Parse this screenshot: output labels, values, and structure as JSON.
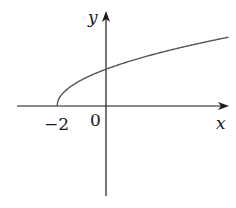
{
  "chart_data": {
    "type": "line",
    "title": "",
    "function": "y = sqrt(x + 2)",
    "xlabel": "x",
    "ylabel": "y",
    "x_tick_labels": [
      "-2",
      "0"
    ],
    "x": [
      -2,
      -1.5,
      -1,
      0,
      1,
      2,
      3,
      4,
      5
    ],
    "series": [
      {
        "name": "curve",
        "values": [
          0,
          0.707,
          1,
          1.414,
          1.732,
          2,
          2.236,
          2.449,
          2.646
        ]
      }
    ],
    "xlim": [
      -3.8,
      5.2
    ],
    "ylim": [
      -3.5,
      3.6
    ],
    "grid": false,
    "legend": "none"
  },
  "labels": {
    "x_axis": "x",
    "y_axis": "y",
    "origin": "0",
    "tick_neg2": "−2"
  },
  "colors": {
    "axis": "#1a1a1a",
    "curve": "#555555"
  }
}
